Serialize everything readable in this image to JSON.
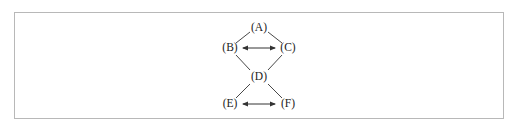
{
  "diagram": {
    "nodes": [
      {
        "id": "A",
        "label": "(A)",
        "x": 259,
        "y": 28
      },
      {
        "id": "B",
        "label": "(B)",
        "x": 230,
        "y": 48
      },
      {
        "id": "C",
        "label": "(C)",
        "x": 288,
        "y": 48
      },
      {
        "id": "D",
        "label": "(D)",
        "x": 259,
        "y": 77
      },
      {
        "id": "E",
        "label": "(E)",
        "x": 230,
        "y": 104
      },
      {
        "id": "F",
        "label": "(F)",
        "x": 288,
        "y": 104
      }
    ],
    "edges": [
      {
        "from": "A",
        "to": "B",
        "type": "line"
      },
      {
        "from": "A",
        "to": "C",
        "type": "line"
      },
      {
        "from": "B",
        "to": "C",
        "type": "double-arrow"
      },
      {
        "from": "B",
        "to": "D",
        "type": "line"
      },
      {
        "from": "C",
        "to": "D",
        "type": "line"
      },
      {
        "from": "D",
        "to": "E",
        "type": "line"
      },
      {
        "from": "D",
        "to": "F",
        "type": "line"
      },
      {
        "from": "E",
        "to": "F",
        "type": "double-arrow"
      }
    ],
    "colors": {
      "stroke": "#333333",
      "border": "#b8b8b8"
    }
  }
}
